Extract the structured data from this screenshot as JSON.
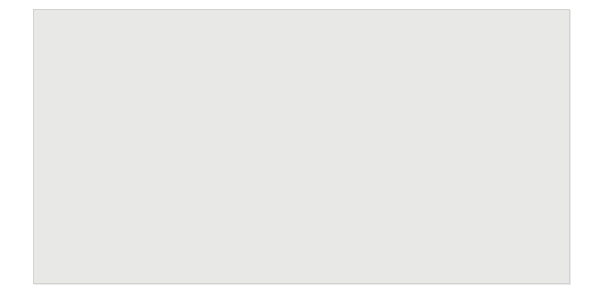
{
  "figure": {
    "background_color": "#e8e8e6",
    "curve_color": "#3a3a3a",
    "grid_color": "#4a4a4a",
    "marker_color": "#151515",
    "guide_color": "#6b6b6b"
  },
  "chart_data": {
    "type": "line",
    "title": "",
    "xlabel": "Molecular weight",
    "ylabel": "K_D",
    "ylabel_base": "K",
    "ylabel_sub": "D",
    "xscale": "log",
    "xlim": [
      1000,
      1000000
    ],
    "ylim": [
      0,
      1.0
    ],
    "grid": true,
    "legend": "none",
    "x_tick_labels": [
      {
        "value": 1000,
        "mantissa": "10",
        "exponent": "3"
      },
      {
        "value": 10000,
        "mantissa": "10",
        "exponent": "4"
      },
      {
        "value": 100000,
        "mantissa": "10",
        "exponent": "5"
      },
      {
        "value": 1000000,
        "mantissa": "10",
        "exponent": "6"
      }
    ],
    "y_tick_labels": [
      "1.0",
      "0.5",
      "0"
    ],
    "y_tick_values": [
      1.0,
      0.5,
      0
    ],
    "y_minor_ticks": [
      0.1,
      0.2,
      0.3,
      0.4,
      0.6,
      0.7,
      0.8,
      0.9
    ],
    "series": [
      {
        "name": "calibration curve",
        "description": "K_D versus molecular weight sigmoidal calibration curve",
        "points": [
          {
            "mw": 1000,
            "kd": 1.0
          },
          {
            "mw": 1500,
            "kd": 0.995
          },
          {
            "mw": 2000,
            "kd": 0.985
          },
          {
            "mw": 2600,
            "kd": 0.965
          },
          {
            "mw": 3200,
            "kd": 0.94
          },
          {
            "mw": 4000,
            "kd": 0.9
          },
          {
            "mw": 5000,
            "kd": 0.855
          },
          {
            "mw": 6300,
            "kd": 0.8
          },
          {
            "mw": 8000,
            "kd": 0.735
          },
          {
            "mw": 10000,
            "kd": 0.665
          },
          {
            "mw": 12500,
            "kd": 0.6
          },
          {
            "mw": 16000,
            "kd": 0.52
          },
          {
            "mw": 20000,
            "kd": 0.455
          },
          {
            "mw": 25000,
            "kd": 0.385
          },
          {
            "mw": 32000,
            "kd": 0.315
          },
          {
            "mw": 40000,
            "kd": 0.25
          },
          {
            "mw": 50000,
            "kd": 0.195
          },
          {
            "mw": 63000,
            "kd": 0.14
          },
          {
            "mw": 80000,
            "kd": 0.095
          },
          {
            "mw": 100000,
            "kd": 0.06
          },
          {
            "mw": 130000,
            "kd": 0.032
          },
          {
            "mw": 160000,
            "kd": 0.018
          },
          {
            "mw": 200000,
            "kd": 0.009
          },
          {
            "mw": 300000,
            "kd": 0.004
          },
          {
            "mw": 500000,
            "kd": 0.002
          },
          {
            "mw": 1000000,
            "kd": 0.001
          }
        ]
      }
    ],
    "data_points": [
      {
        "label": "Cytochrome c",
        "mw": 12400,
        "kd": 0.605,
        "marker": "filled-circle"
      },
      {
        "label": "Ribonuclease A",
        "mw": 13700,
        "kd": 0.575,
        "marker": "filled-circle"
      },
      {
        "label": "Soybean trypsin inhibitor",
        "mw": 21500,
        "kd": 0.438,
        "marker": "filled-circle"
      },
      {
        "label": "Ovalbumin",
        "mw": 43000,
        "kd": 0.232,
        "marker": "filled-circle"
      },
      {
        "label": "Bovine serum albumin",
        "mw": 67000,
        "kd": 0.128,
        "marker": "filled-circle"
      },
      {
        "label": "Bovine serum albumin dimer",
        "mw": 134000,
        "kd": 0.031,
        "marker": "filled-circle"
      },
      {
        "label": "Thyroglobuin",
        "mw": 500000,
        "kd": 0.002,
        "marker": "filled-circle"
      }
    ],
    "annotations": [
      {
        "name": "unknown-sample-guide",
        "type": "dashed-guide-with-arrow",
        "kd": 0.39,
        "mw": 26500,
        "marker": "open-square",
        "description": "Horizontal dashed line from the K_D axis at 0.39 to the curve, then a vertical dashed line dropping to the molecular-weight axis ending in a solid arrowhead"
      }
    ]
  }
}
